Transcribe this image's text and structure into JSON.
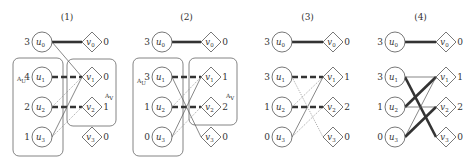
{
  "figure": {
    "panels": [
      {
        "title": "(1)",
        "ux": 42,
        "vx": 92,
        "u_weights": [
          "3",
          "4",
          "2",
          "1"
        ],
        "v_weights": [
          "0",
          "0",
          "1",
          "0"
        ],
        "boxes": [
          {
            "name": "A_U",
            "label": "A",
            "sub": "U",
            "x": 13,
            "y": 58,
            "w": 50,
            "h": 98,
            "lx": 17,
            "ly": 81
          },
          {
            "name": "A_V",
            "label": "A",
            "sub": "V",
            "x": 67,
            "y": 59,
            "w": 49,
            "h": 67,
            "lx": 105,
            "ly": 98
          }
        ],
        "edges": [
          {
            "u": 0,
            "v": 0,
            "style": "thick"
          },
          {
            "u": 0,
            "v": 1,
            "style": "thin"
          },
          {
            "u": 1,
            "v": 1,
            "style": "dashed"
          },
          {
            "u": 2,
            "v": 2,
            "style": "dashed"
          },
          {
            "u": 2,
            "v": 1,
            "style": "dotted"
          },
          {
            "u": 3,
            "v": 1,
            "style": "thin"
          },
          {
            "u": 3,
            "v": 2,
            "style": "dotted"
          }
        ]
      },
      {
        "title": "(2)",
        "ux": 162,
        "vx": 211,
        "u_weights": [
          "3",
          "3",
          "1",
          "0"
        ],
        "v_weights": [
          "0",
          "1",
          "2",
          "0"
        ],
        "boxes": [
          {
            "name": "A_U",
            "label": "A",
            "sub": "U",
            "x": 133,
            "y": 58,
            "w": 50,
            "h": 98,
            "lx": 137,
            "ly": 83
          },
          {
            "name": "A_V",
            "label": "A",
            "sub": "V",
            "x": 189,
            "y": 58,
            "w": 48,
            "h": 67,
            "lx": 226,
            "ly": 98
          }
        ],
        "edges": [
          {
            "u": 0,
            "v": 0,
            "style": "thick"
          },
          {
            "u": 1,
            "v": 1,
            "style": "dashed"
          },
          {
            "u": 2,
            "v": 2,
            "style": "dashed"
          },
          {
            "u": 1,
            "v": 3,
            "style": "thin"
          },
          {
            "u": 3,
            "v": 1,
            "style": "thin"
          },
          {
            "u": 2,
            "v": 1,
            "style": "dotted"
          },
          {
            "u": 3,
            "v": 2,
            "style": "dotted"
          }
        ]
      },
      {
        "title": "(3)",
        "ux": 282,
        "vx": 333,
        "u_weights": [
          "3",
          "3",
          "1",
          "0"
        ],
        "v_weights": [
          "0",
          "1",
          "2",
          "0"
        ],
        "boxes": [],
        "edges": [
          {
            "u": 0,
            "v": 0,
            "style": "thick"
          },
          {
            "u": 1,
            "v": 1,
            "style": "dashed"
          },
          {
            "u": 2,
            "v": 2,
            "style": "dashed"
          },
          {
            "u": 1,
            "v": 3,
            "style": "dotted"
          },
          {
            "u": 2,
            "v": 1,
            "style": "dotted"
          },
          {
            "u": 3,
            "v": 1,
            "style": "thin"
          },
          {
            "u": 3,
            "v": 2,
            "style": "dotted"
          }
        ]
      },
      {
        "title": "(4)",
        "ux": 395,
        "vx": 446,
        "u_weights": [
          "3",
          "3",
          "1",
          "0"
        ],
        "v_weights": [
          "0",
          "1",
          "2",
          "0"
        ],
        "boxes": [],
        "edges": [
          {
            "u": 0,
            "v": 0,
            "style": "thick"
          },
          {
            "u": 1,
            "v": 1,
            "style": "thin"
          },
          {
            "u": 1,
            "v": 3,
            "style": "thick"
          },
          {
            "u": 2,
            "v": 1,
            "style": "thick"
          },
          {
            "u": 2,
            "v": 2,
            "style": "thin"
          },
          {
            "u": 3,
            "v": 1,
            "style": "thin"
          },
          {
            "u": 3,
            "v": 2,
            "style": "thick"
          }
        ]
      }
    ],
    "row_y": [
      42,
      77,
      107,
      137
    ],
    "title_y": 20,
    "u_prefix": "u",
    "v_prefix": "v",
    "subscripts": [
      "0",
      "1",
      "2",
      "3"
    ]
  }
}
